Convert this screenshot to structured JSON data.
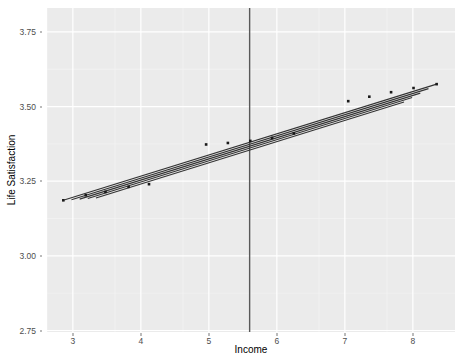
{
  "chart_data": {
    "type": "line",
    "title": "",
    "xlabel": "Income",
    "ylabel": "Life Satisfaction",
    "xlim": [
      2.62,
      8.62
    ],
    "ylim": [
      2.745,
      3.83
    ],
    "xticks": [
      "3",
      "4",
      "5",
      "6",
      "7",
      "8"
    ],
    "xtick_values": [
      3,
      4,
      5,
      6,
      7,
      8
    ],
    "yticks": [
      "2.75",
      "3.00",
      "3.25",
      "3.50",
      "3.75"
    ],
    "ytick_values": [
      2.75,
      3.0,
      3.25,
      3.5,
      3.75
    ],
    "grid": true,
    "legend": "none",
    "panel_bg": "#ebebeb",
    "grid_color": "#ffffff",
    "line_color": "#333333",
    "point_color": "#1a1a1a",
    "vline_color": "#595959",
    "annotations": [
      {
        "name": "vertical-reference-line",
        "type": "vline",
        "x": 5.6
      }
    ],
    "series": [
      {
        "name": "fit-line-1",
        "type": "line",
        "x": [
          2.86,
          8.35
        ],
        "y": [
          3.186,
          3.575
        ]
      },
      {
        "name": "fit-line-2",
        "type": "line",
        "x": [
          2.98,
          8.23
        ],
        "y": [
          3.188,
          3.56
        ]
      },
      {
        "name": "fit-line-3",
        "type": "line",
        "x": [
          3.1,
          8.11
        ],
        "y": [
          3.19,
          3.545
        ]
      },
      {
        "name": "fit-line-4",
        "type": "line",
        "x": [
          3.22,
          7.99
        ],
        "y": [
          3.192,
          3.53
        ]
      },
      {
        "name": "fit-line-5",
        "type": "line",
        "x": [
          3.34,
          7.87
        ],
        "y": [
          3.194,
          3.515
        ]
      },
      {
        "name": "observed-points",
        "type": "scatter",
        "x": [
          2.86,
          3.19,
          3.48,
          3.82,
          4.12,
          4.96,
          5.28,
          5.61,
          5.93,
          6.25,
          7.05,
          7.36,
          7.68,
          8.01,
          8.35
        ],
        "y": [
          3.186,
          3.203,
          3.214,
          3.231,
          3.24,
          3.373,
          3.378,
          3.385,
          3.395,
          3.41,
          3.518,
          3.533,
          3.548,
          3.562,
          3.575
        ]
      }
    ]
  },
  "axis": {
    "y_title": "Life Satisfaction",
    "x_title": "Income",
    "y_labels": [
      "3.75",
      "3.50",
      "3.25",
      "3.00",
      "2.75"
    ],
    "x_labels": [
      "3",
      "4",
      "5",
      "6",
      "7",
      "8"
    ]
  }
}
